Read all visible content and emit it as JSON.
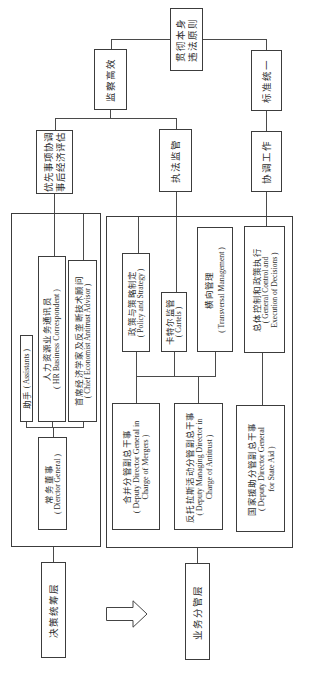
{
  "principles": {
    "per_se_illegality": {
      "lines": [
        "贯彻本身",
        "违法原则"
      ]
    },
    "efficient_supervision": {
      "label": "监察高效"
    },
    "unified_standards": {
      "label": "标准统一"
    },
    "priority_coordination": {
      "lines": [
        "优先事项协调",
        "事后经济评估"
      ]
    },
    "enforcement_supervision": {
      "label": "执法监管"
    },
    "coordination_work": {
      "label": "协调工作"
    }
  },
  "decision_layer": {
    "label": "决策统筹层",
    "director": {
      "zh": "常务董事",
      "en": "( Dierctor General )"
    },
    "assistants": {
      "zh": "助手",
      "en": "( Assistants )"
    },
    "hr": {
      "zh": "人力资源业务通讯员",
      "en": "( HR Business Correspondent )"
    },
    "chief_economist": {
      "zh": "首席经济学家及反垄断技术顾问",
      "en": "( Chief Economist Antitrust Advisor )"
    }
  },
  "business_layer": {
    "label": "业务分管层",
    "units": [
      {
        "zh": "政策与策略制定",
        "en": [
          "( Policy and Strategy )"
        ]
      },
      {
        "zh": "卡特尔监管",
        "en": [
          "( Cartels )"
        ]
      },
      {
        "zh": "横向管理",
        "en": [
          "( Transversal Management )"
        ]
      },
      {
        "zh": "总体控制和政策执行",
        "en": [
          "( General Control and",
          "Execution of Decisions )"
        ]
      }
    ],
    "deputies": [
      {
        "zh": "合并分管副总干事",
        "en": [
          "( Deputy Director General in",
          "Charge of Mergers )"
        ]
      },
      {
        "zh": "反托拉斯活动分管副总干事",
        "en": [
          "( Deputy Managing Director in",
          "Charge of Antitrust )"
        ]
      },
      {
        "zh": "国家援助分管副总干事",
        "en": [
          "( Deputy Director General",
          "for State Aid )"
        ]
      }
    ]
  },
  "transition_icon": "right-arrow-icon"
}
